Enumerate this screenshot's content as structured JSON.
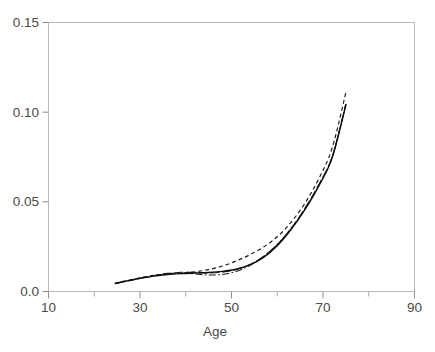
{
  "chart_data": {
    "type": "line",
    "title": "",
    "subtitle": "",
    "xlabel": "Age",
    "ylabel": "",
    "xlim": [
      10,
      90
    ],
    "ylim": [
      0.0,
      0.15
    ],
    "grid": false,
    "legend": "none",
    "background_color": "#ffffff",
    "frame_color": "#b9b9b9",
    "text_color": "#4a4a4a",
    "xticks": [
      10,
      30,
      50,
      70,
      90
    ],
    "xtick_labels": [
      "10",
      "30",
      "50",
      "70",
      "90"
    ],
    "xminor_ticks": [
      20,
      40,
      60,
      80
    ],
    "yticks": [
      0.0,
      0.05,
      0.1,
      0.15
    ],
    "ytick_labels": [
      "0.0",
      "0.05",
      "0.10",
      "0.15"
    ],
    "x": [
      25,
      30,
      35,
      40,
      45,
      50,
      55,
      60,
      65,
      70,
      75
    ],
    "series": [
      {
        "name": "curve-solid",
        "style": "solid",
        "color": "#0d0d0d",
        "x": [
          24.6,
          27,
          30,
          33,
          36,
          39,
          42,
          45,
          48,
          51,
          54,
          57,
          60,
          63,
          66,
          69,
          72,
          75
        ],
        "values": [
          0.0045,
          0.0058,
          0.0073,
          0.0086,
          0.0095,
          0.01,
          0.0103,
          0.0106,
          0.0112,
          0.0124,
          0.0148,
          0.019,
          0.0255,
          0.0345,
          0.0455,
          0.0585,
          0.0745,
          0.104
        ]
      },
      {
        "name": "curve-dashed",
        "style": "dashed",
        "color": "#171717",
        "x": [
          24.6,
          27,
          30,
          33,
          36,
          39,
          42,
          45,
          48,
          51,
          54,
          57,
          60,
          63,
          66,
          69,
          72,
          75
        ],
        "values": [
          0.0046,
          0.006,
          0.0076,
          0.009,
          0.0099,
          0.0104,
          0.011,
          0.0122,
          0.0142,
          0.017,
          0.0205,
          0.0248,
          0.0305,
          0.0385,
          0.049,
          0.0625,
          0.08,
          0.111
        ]
      },
      {
        "name": "curve-dashdot",
        "style": "dashdot",
        "color": "#1c1c1c",
        "x": [
          24.6,
          27,
          30,
          33,
          36,
          39,
          42,
          45,
          48,
          51,
          54,
          57,
          60,
          63,
          66,
          69,
          72,
          75
        ],
        "values": [
          0.0044,
          0.0057,
          0.0072,
          0.0087,
          0.0098,
          0.0102,
          0.0098,
          0.0092,
          0.0095,
          0.0112,
          0.0145,
          0.0195,
          0.0262,
          0.035,
          0.0458,
          0.059,
          0.075,
          0.1045
        ]
      },
      {
        "name": "curve-longdash",
        "style": "longdash",
        "color": "#202020",
        "x": [
          24.6,
          27,
          30,
          33,
          36,
          39,
          42,
          45,
          48,
          51,
          54,
          57,
          60,
          63,
          66,
          69,
          72,
          75
        ],
        "values": [
          0.0045,
          0.0059,
          0.0075,
          0.0089,
          0.0101,
          0.0107,
          0.0106,
          0.0104,
          0.0108,
          0.0122,
          0.015,
          0.0196,
          0.0262,
          0.0352,
          0.0462,
          0.0592,
          0.0752,
          0.1045
        ]
      }
    ]
  },
  "axis": {
    "x_title": "Age"
  }
}
